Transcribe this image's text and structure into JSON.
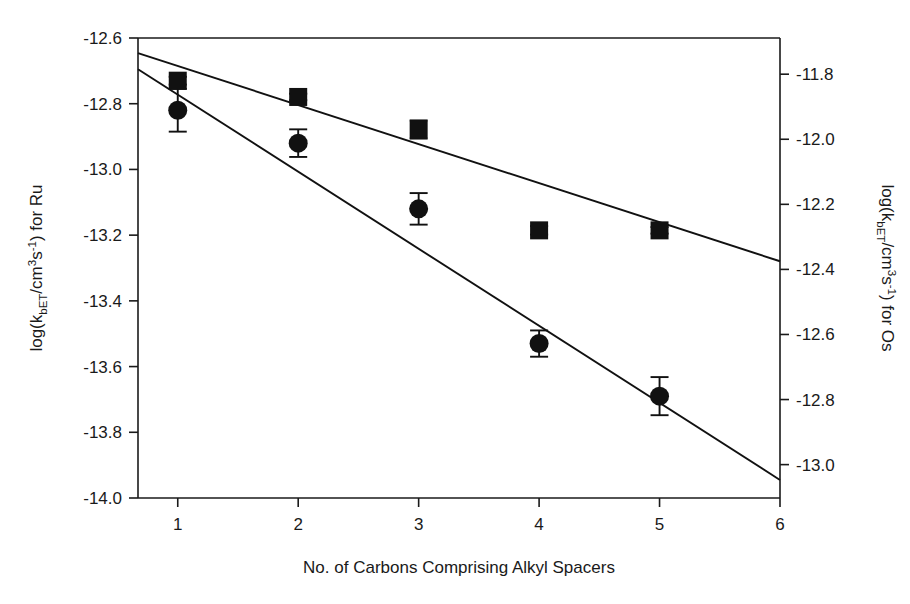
{
  "chart_data": {
    "type": "scatter",
    "title": "",
    "subtitle": "",
    "xlabel": "No. of Carbons Comprising Alkyl Spacers",
    "ylabel_left": "log(kbET/cm3s-1) for Ru",
    "ylabel_right": "log(kbET/cm3s-1) for Os",
    "grid": false,
    "legend_position": "none",
    "x": [
      1,
      2,
      3,
      4,
      5
    ],
    "xlim": [
      0.67,
      6
    ],
    "xticks": [
      1,
      2,
      3,
      4,
      5,
      6
    ],
    "xtick_labels": [
      "1",
      "2",
      "3",
      "4",
      "5",
      "6"
    ],
    "ylim_left": [
      -14.0,
      -12.6
    ],
    "yticks_left": [
      -12.6,
      -12.8,
      -13.0,
      -13.2,
      -13.4,
      -13.6,
      -13.8,
      -14.0
    ],
    "ytick_labels_left": [
      "-12.6",
      "-12.8",
      "-13.0",
      "-13.2",
      "-13.4",
      "-13.6",
      "-13.8",
      "-14.0"
    ],
    "ylim_right": [
      -13.1026,
      -11.6888
    ],
    "yticks_right": [
      -11.8,
      -12.0,
      -12.2,
      -12.4,
      -12.6,
      -12.8,
      -13.0
    ],
    "ytick_labels_right": [
      "-11.8",
      "-12.0",
      "-12.2",
      "-12.4",
      "-12.6",
      "-12.8",
      "-13.0"
    ],
    "series": [
      {
        "name": "Os",
        "axis": "right",
        "marker": "square",
        "color": "#111111",
        "values": [
          -11.82,
          -11.87,
          -11.97,
          -12.28,
          -12.28
        ],
        "yerr": [
          0.012,
          0.01,
          0.028,
          0.013,
          0.01
        ],
        "fit_line": {
          "x_start": 0.67,
          "x_end": 6.0,
          "y_start": -11.735,
          "y_end": -12.375
        }
      },
      {
        "name": "Ru",
        "axis": "left",
        "marker": "circle",
        "color": "#111111",
        "values": [
          -12.82,
          -12.92,
          -13.12,
          -13.53,
          -13.69
        ],
        "yerr": [
          0.065,
          0.042,
          0.048,
          0.04,
          0.058
        ],
        "fit_line": {
          "x_start": 0.67,
          "x_end": 6.0,
          "y_start": -12.695,
          "y_end": -13.945
        }
      }
    ]
  },
  "axes": {
    "x_title": "No. of Carbons Comprising Alkyl Spacers",
    "left_title_prefix": "log(k",
    "left_title_sub": "bET",
    "left_title_mid": "/cm",
    "left_title_sup1": "3",
    "left_title_s": "s",
    "left_title_sup2": "-1",
    "left_title_suffix": ") for Ru",
    "right_title_prefix": "log(k",
    "right_title_sub": "bET",
    "right_title_mid": "/cm",
    "right_title_sup1": "3",
    "right_title_s": "s",
    "right_title_sup2": "-1",
    "right_title_suffix": ") for Os"
  }
}
